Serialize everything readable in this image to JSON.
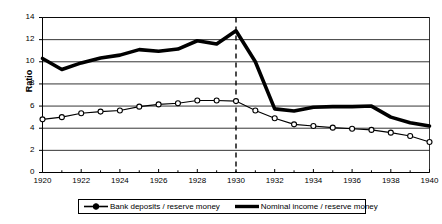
{
  "chart_data": {
    "type": "line",
    "title": "",
    "xlabel": "",
    "ylabel": "Ratio",
    "xlim": [
      1920,
      1940
    ],
    "ylim": [
      0,
      14
    ],
    "ytick_values": [
      0,
      2,
      4,
      6,
      8,
      10,
      12,
      14
    ],
    "xtick_values": [
      1920,
      1922,
      1924,
      1926,
      1928,
      1930,
      1932,
      1934,
      1936,
      1938,
      1940
    ],
    "grid": "horizontal",
    "legend_position": "bottom",
    "x": [
      1920,
      1921,
      1922,
      1923,
      1924,
      1925,
      1926,
      1927,
      1928,
      1929,
      1930,
      1931,
      1932,
      1933,
      1934,
      1935,
      1936,
      1937,
      1938,
      1939,
      1940
    ],
    "annotations": [
      {
        "type": "vertical-dashed-line",
        "x": 1930,
        "label": ""
      }
    ],
    "series": [
      {
        "name": "Bank deposits / reserve money",
        "style": "thin-line-open-circle-markers",
        "color": "#000000",
        "values": [
          4.8,
          5.0,
          5.35,
          5.5,
          5.6,
          5.95,
          6.15,
          6.25,
          6.5,
          6.5,
          6.45,
          5.6,
          4.9,
          4.35,
          4.2,
          4.05,
          3.95,
          3.85,
          3.6,
          3.3,
          2.75
        ]
      },
      {
        "name": "Nominal income / reserve money",
        "style": "thick-line-no-markers",
        "color": "#000000",
        "values": [
          10.3,
          9.3,
          9.9,
          10.35,
          10.6,
          11.1,
          10.95,
          11.15,
          11.9,
          11.6,
          12.8,
          10.0,
          5.75,
          5.55,
          5.9,
          5.95,
          5.95,
          6.0,
          5.0,
          4.5,
          4.2
        ]
      }
    ]
  },
  "ylabel_text": "Ratio",
  "legend": {
    "entry1": "Bank deposits / reserve money",
    "entry2": "Nominal income / reserve money"
  }
}
